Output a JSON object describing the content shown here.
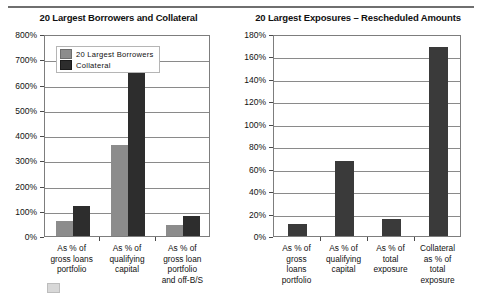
{
  "figure": {
    "has_top_rule": true
  },
  "charts": [
    {
      "title": "20 Largest Borrowers and Collateral",
      "legend": {
        "position": "top-left-inside",
        "entries": [
          "20 Largest Borrowers",
          "Collateral"
        ]
      }
    },
    {
      "title": "20 Largest Exposures – Rescheduled Amounts",
      "legend": null
    }
  ],
  "chart_data": [
    {
      "type": "bar",
      "title": "20 Largest Borrowers and Collateral",
      "xlabel": "",
      "ylabel": "",
      "ylim": [
        0,
        800
      ],
      "yticks": [
        0,
        100,
        200,
        300,
        400,
        500,
        600,
        700,
        800
      ],
      "ytick_labels": [
        "0%",
        "100%",
        "200%",
        "300%",
        "400%",
        "500%",
        "600%",
        "700%",
        "800%"
      ],
      "grid": true,
      "legend_position": "upper left",
      "categories": [
        "As % of\ngross loans\nportfolio",
        "As % of\nqualifying\ncapital",
        "As % of\ngross loan\nportfolio\nand off-B/S"
      ],
      "series": [
        {
          "name": "20 Largest Borrowers",
          "color": "#8c8c8c",
          "values": [
            60,
            360,
            45
          ]
        },
        {
          "name": "Collateral",
          "color": "#2d2d2d",
          "values": [
            118,
            700,
            80
          ]
        }
      ]
    },
    {
      "type": "bar",
      "title": "20 Largest Exposures – Rescheduled Amounts",
      "xlabel": "",
      "ylabel": "",
      "ylim": [
        0,
        180
      ],
      "yticks": [
        0,
        20,
        40,
        60,
        80,
        100,
        120,
        140,
        160,
        180
      ],
      "ytick_labels": [
        "0%",
        "20%",
        "40%",
        "60%",
        "80%",
        "100%",
        "120%",
        "140%",
        "160%",
        "180%"
      ],
      "grid": true,
      "legend_position": "none",
      "categories": [
        "As % of\ngross\nloans\nportfolio",
        "As % of\nqualifying\ncapital",
        "As % of\ntotal\nexposure",
        "Collateral\nas % of\ntotal\nexposure"
      ],
      "series": [
        {
          "name": "Rescheduled Amounts",
          "color": "#3a3a3a",
          "values": [
            11,
            67,
            15,
            168
          ]
        }
      ]
    }
  ]
}
